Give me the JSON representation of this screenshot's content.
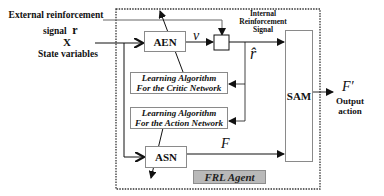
{
  "inputs": {
    "external_label_line1": "External reinforcement",
    "external_label_line2": "signal",
    "external_symbol": "r",
    "state_symbol": "X",
    "state_label": "State variables"
  },
  "blocks": {
    "aen": "AEN",
    "asn": "ASN",
    "sam": "SAM",
    "critic_line1": "Learning Algorithm",
    "critic_line2": "For the Critic Network",
    "action_line1": "Learning Algorithm",
    "action_line2": "For the Action Network",
    "agent": "FRL Agent"
  },
  "signals": {
    "v": "v",
    "r_hat": "r̂",
    "F": "F",
    "F_prime": "F′",
    "internal_line1": "Internal",
    "internal_line2": "Reinforcement",
    "internal_line3": "Signal"
  },
  "output": {
    "line1": "Output",
    "line2": "action"
  },
  "colors": {
    "line": "#111111",
    "box_border": "#8a8a8a",
    "agent_fill": "#b9b9b9",
    "dotted_border": "#333333"
  }
}
